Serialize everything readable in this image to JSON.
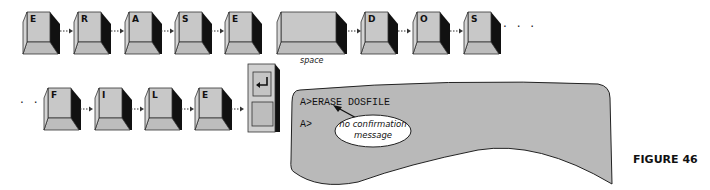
{
  "top_row": {
    "keys": [
      "E",
      "R",
      "A",
      "S",
      "E",
      "",
      "D",
      "O",
      "S"
    ],
    "space_label": "space",
    "continuation": "· · ·"
  },
  "bottom_row": {
    "leading": "· · ·",
    "keys": [
      "F",
      "I",
      "L",
      "E"
    ],
    "enter_key_icon": "enter-return-icon"
  },
  "screen": {
    "command_line": "A>ERASE DOSFILE",
    "prompt_line": "A>",
    "callout": {
      "line1": "no confirmation",
      "line2": "message"
    }
  },
  "figure_label": "FIGURE 46",
  "colors": {
    "key_face": "#c8c8c8",
    "key_shadow": "#111111",
    "screen_fill": "#b9b9b9",
    "outline": "#222222"
  }
}
